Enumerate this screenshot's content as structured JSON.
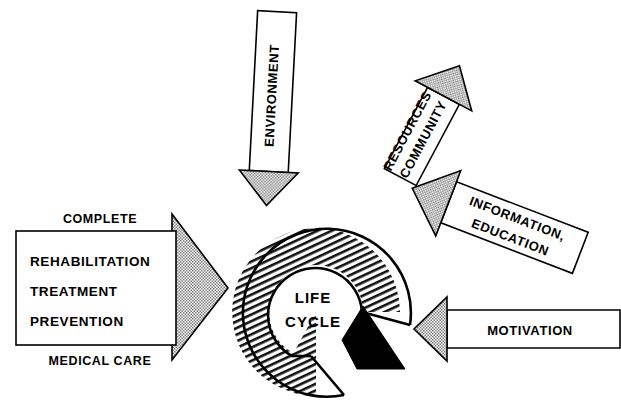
{
  "diagram": {
    "type": "cycle-diagram",
    "background_color": "#ffffff",
    "stroke_color": "#000000",
    "fill_hatch_color": "#000000",
    "arrowhead_fill": "#b4b4b4"
  },
  "core": {
    "name": "life-cycle-ring",
    "line1": "LIFE",
    "line2": "CYCLE",
    "shape": "open-ring-with-arrowhead",
    "gap_sector": "lower-right",
    "arrowhead_color": "#000000"
  },
  "left_block": {
    "caption_top": "COMPLETE",
    "caption_bottom": "MEDICAL CARE",
    "items": [
      "REHABILITATION",
      "TREATMENT",
      "PREVENTION"
    ],
    "arrow_direction": "right"
  },
  "arrows": [
    {
      "id": "environment",
      "lines": [
        "ENVIRONMENT"
      ],
      "direction": "down",
      "angle_deg": 3,
      "text_orientation": "vertical-bottom-up"
    },
    {
      "id": "community-resources",
      "lines": [
        "COMMUNITY",
        "RESOURCES"
      ],
      "direction": "down-left",
      "angle_deg": 61,
      "text_orientation": "rotated"
    },
    {
      "id": "information-education",
      "lines": [
        "INFORMATION,",
        "EDUCATION"
      ],
      "direction": "down-left",
      "angle_deg": 21,
      "text_orientation": "rotated"
    },
    {
      "id": "motivation",
      "lines": [
        "MOTIVATION"
      ],
      "direction": "left",
      "angle_deg": 0,
      "text_orientation": "horizontal"
    }
  ]
}
